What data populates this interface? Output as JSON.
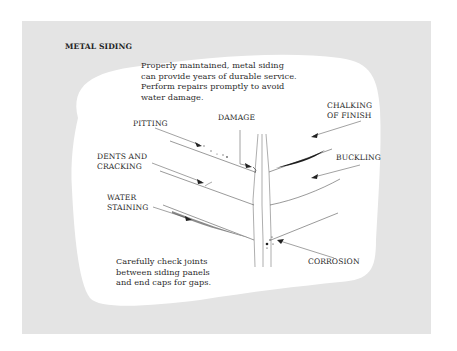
{
  "title": "METAL SIDING",
  "intro": {
    "lines": [
      "Properly maintained, metal siding",
      "can provide years of durable service.",
      "Perform repairs promptly to avoid",
      "water damage."
    ]
  },
  "labels": {
    "pitting": "PITTING",
    "damage": "DAMAGE",
    "chalking": [
      "CHALKING",
      "OF FINISH"
    ],
    "dents": [
      "DENTS AND",
      "CRACKING"
    ],
    "buckling": "BUCKLING",
    "water_staining": [
      "WATER",
      "STAINING"
    ],
    "corrosion": "CORROSION"
  },
  "note": {
    "lines": [
      "Carefully check joints",
      "between siding panels",
      "and end caps for gaps."
    ]
  },
  "colors": {
    "panel_bg": "#e4e4e4",
    "blob_bg": "#ffffff",
    "line": "#555555",
    "text": "#2b2b2b"
  }
}
